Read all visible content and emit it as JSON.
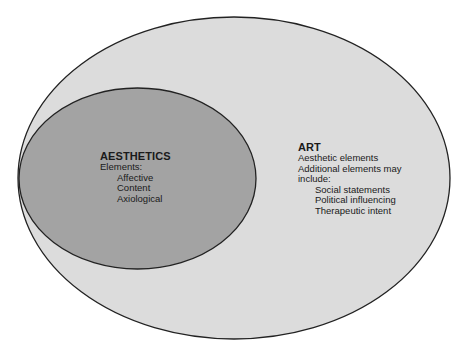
{
  "diagram": {
    "type": "nested-ellipse (subset) diagram",
    "colors": {
      "background": "#ffffff",
      "outer_fill": "#dcdcdc",
      "inner_fill": "#a3a3a3",
      "stroke": "#222222",
      "text": "#1a1a1a"
    },
    "outer": {
      "title": "ART",
      "lines": [
        "Aesthetic elements",
        "Additional elements may",
        "include:"
      ],
      "items": [
        "Social statements",
        "Political influencing",
        "Therapeutic intent"
      ]
    },
    "inner": {
      "title": "AESTHETICS",
      "lines": [
        "Elements:"
      ],
      "items": [
        "Affective",
        "Content",
        "Axiological"
      ]
    }
  }
}
